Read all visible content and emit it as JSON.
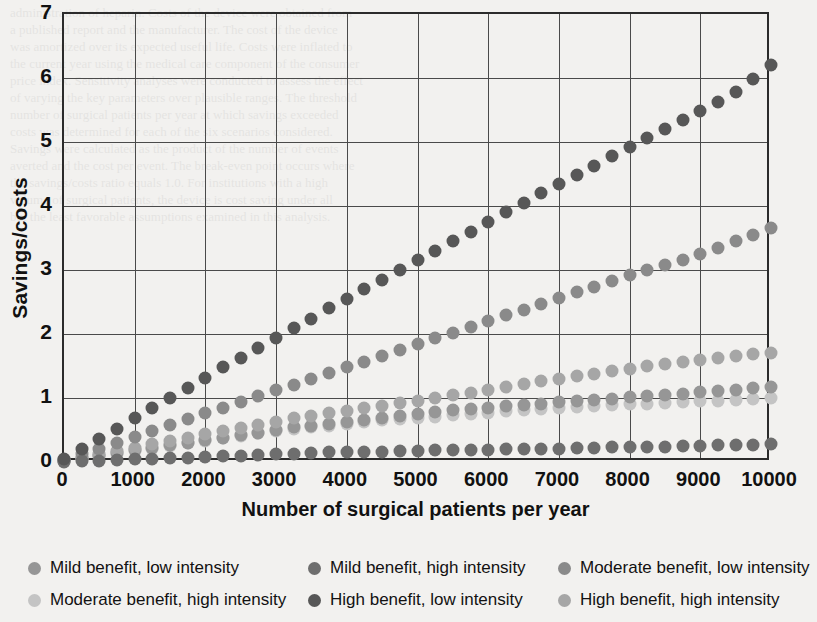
{
  "chart_data": {
    "type": "scatter",
    "title": "",
    "xlabel": "Number of surgical patients per year",
    "ylabel": "Savings/costs",
    "xlim": [
      0,
      10000
    ],
    "ylim": [
      0,
      7
    ],
    "xticks": [
      0,
      1000,
      2000,
      3000,
      4000,
      5000,
      6000,
      7000,
      8000,
      9000,
      10000
    ],
    "xtick_labels": [
      "0",
      "1000",
      "2000",
      "3000",
      "4000",
      "5000",
      "6000",
      "7000",
      "8000",
      "9000",
      "10000"
    ],
    "yticks": [
      0,
      1,
      2,
      3,
      4,
      5,
      6,
      7
    ],
    "ytick_labels": [
      "0",
      "1",
      "2",
      "3",
      "4",
      "5",
      "6",
      "7"
    ],
    "grid": "horizontal-and-vertical",
    "legend_position": "below",
    "x": [
      0,
      250,
      500,
      750,
      1000,
      1250,
      1500,
      1750,
      2000,
      2250,
      2500,
      2750,
      3000,
      3250,
      3500,
      3750,
      4000,
      4250,
      4500,
      4750,
      5000,
      5250,
      5500,
      5750,
      6000,
      6250,
      6500,
      6750,
      7000,
      7250,
      7500,
      7750,
      8000,
      8250,
      8500,
      8750,
      9000,
      9250,
      9500,
      9750,
      10000
    ],
    "series": [
      {
        "name": "High benefit, low intensity",
        "color": "#575757",
        "values": [
          0.05,
          0.2,
          0.36,
          0.52,
          0.68,
          0.84,
          1.0,
          1.16,
          1.32,
          1.48,
          1.62,
          1.78,
          1.93,
          2.09,
          2.24,
          2.4,
          2.55,
          2.7,
          2.85,
          3.0,
          3.15,
          3.3,
          3.45,
          3.6,
          3.75,
          3.9,
          4.05,
          4.2,
          4.34,
          4.49,
          4.63,
          4.78,
          4.92,
          5.07,
          5.21,
          5.35,
          5.49,
          5.63,
          5.78,
          5.99,
          6.2
        ]
      },
      {
        "name": "Moderate benefit, low intensity",
        "color": "#8a8a8a",
        "values": [
          0.03,
          0.12,
          0.21,
          0.3,
          0.39,
          0.49,
          0.58,
          0.67,
          0.76,
          0.85,
          0.94,
          1.03,
          1.12,
          1.21,
          1.3,
          1.39,
          1.48,
          1.57,
          1.66,
          1.75,
          1.84,
          1.93,
          2.02,
          2.11,
          2.2,
          2.29,
          2.38,
          2.47,
          2.56,
          2.65,
          2.74,
          2.83,
          2.92,
          3.0,
          3.08,
          3.16,
          3.25,
          3.35,
          3.45,
          3.55,
          3.66
        ]
      },
      {
        "name": "High benefit, high intensity",
        "color": "#a6a6a6",
        "values": [
          0.02,
          0.07,
          0.12,
          0.17,
          0.22,
          0.28,
          0.33,
          0.38,
          0.43,
          0.48,
          0.53,
          0.58,
          0.63,
          0.68,
          0.72,
          0.76,
          0.8,
          0.84,
          0.88,
          0.92,
          0.96,
          1.0,
          1.04,
          1.08,
          1.12,
          1.17,
          1.22,
          1.26,
          1.3,
          1.34,
          1.38,
          1.42,
          1.46,
          1.5,
          1.53,
          1.56,
          1.59,
          1.62,
          1.65,
          1.68,
          1.71
        ]
      },
      {
        "name": "Mild benefit, low intensity",
        "color": "#969696",
        "values": [
          0.02,
          0.06,
          0.1,
          0.14,
          0.18,
          0.22,
          0.26,
          0.3,
          0.34,
          0.38,
          0.42,
          0.46,
          0.5,
          0.54,
          0.57,
          0.6,
          0.63,
          0.66,
          0.69,
          0.72,
          0.75,
          0.78,
          0.81,
          0.83,
          0.85,
          0.87,
          0.89,
          0.91,
          0.93,
          0.95,
          0.97,
          0.99,
          1.01,
          1.03,
          1.05,
          1.07,
          1.09,
          1.11,
          1.13,
          1.15,
          1.17
        ]
      },
      {
        "name": "Moderate benefit, high intensity",
        "color": "#c4c4c4",
        "values": [
          0.01,
          0.05,
          0.09,
          0.13,
          0.17,
          0.21,
          0.25,
          0.29,
          0.33,
          0.37,
          0.41,
          0.45,
          0.48,
          0.51,
          0.54,
          0.57,
          0.6,
          0.63,
          0.65,
          0.67,
          0.69,
          0.71,
          0.73,
          0.75,
          0.77,
          0.79,
          0.81,
          0.83,
          0.85,
          0.86,
          0.87,
          0.89,
          0.9,
          0.91,
          0.92,
          0.94,
          0.95,
          0.96,
          0.97,
          0.99,
          1.0
        ]
      },
      {
        "name": "Mild benefit, high intensity",
        "color": "#6e6e6e",
        "values": [
          0.0,
          0.01,
          0.02,
          0.03,
          0.04,
          0.05,
          0.06,
          0.07,
          0.08,
          0.09,
          0.1,
          0.11,
          0.12,
          0.13,
          0.14,
          0.15,
          0.15,
          0.16,
          0.16,
          0.17,
          0.17,
          0.18,
          0.18,
          0.19,
          0.19,
          0.2,
          0.2,
          0.21,
          0.21,
          0.22,
          0.22,
          0.23,
          0.23,
          0.24,
          0.24,
          0.25,
          0.25,
          0.26,
          0.26,
          0.27,
          0.28
        ]
      }
    ]
  },
  "legend": {
    "items": [
      {
        "label": "Mild benefit, low intensity",
        "color": "#969696"
      },
      {
        "label": "Mild benefit, high intensity",
        "color": "#6e6e6e"
      },
      {
        "label": "Moderate benefit, low intensity",
        "color": "#8a8a8a"
      },
      {
        "label": "Moderate benefit, high intensity",
        "color": "#c4c4c4"
      },
      {
        "label": "High benefit, low intensity",
        "color": "#575757"
      },
      {
        "label": "High benefit, high intensity",
        "color": "#a6a6a6"
      }
    ]
  },
  "page_bleed": {
    "lines": [
      "administration of heparin. Costs of the device were obtained from",
      "a published report and the manufacturer. The cost of the device",
      "was amortized over its expected useful life. Costs were inflated to",
      "the current year using the medical care component of the consumer",
      "price index. Sensitivity analyses were conducted to assess the effect",
      "of varying the key parameters over plausible ranges. The threshold",
      "number of surgical patients per year at which savings exceeded",
      "costs was determined for each of the six scenarios considered.",
      "Savings were calculated as the product of the number of events",
      "averted and the cost per event. The break-even point occurs where",
      "the savings/costs ratio equals 1.0. For institutions with a high",
      "volume of surgical patients, the device is cost saving under all",
      "but the least favorable assumptions examined in this analysis."
    ]
  }
}
